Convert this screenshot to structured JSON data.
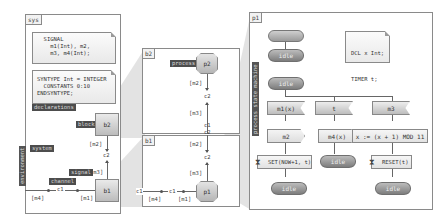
{
  "sys_panel": {
    "tag": "sys",
    "signal_note": "  SIGNAL\n    m1(Int), m2,\n    m3, m4(Int);",
    "syntype_note": "SYNTYPE Int = INTEGER\n  CONSTANTS 0:10\nENDSYNTYPE;",
    "labels": {
      "declarations": "declarations",
      "block": "block",
      "system": "system",
      "signal": "signal",
      "channel": "channel",
      "environment": "environment"
    },
    "blocks": {
      "b2": "b2",
      "b1": "b1"
    },
    "channels": {
      "c1": "c1",
      "c2": "c2"
    },
    "signal_lists": {
      "m2": "[m2]",
      "m3": "[m3]",
      "m4": "[m4]",
      "m1": "[m1]"
    }
  },
  "b2_panel": {
    "tag": "b2",
    "process_label": "process",
    "process": "p2",
    "channel": "c2",
    "signal_m2": "[m2]",
    "signal_m3": "[m3]",
    "gate_c1": "c1",
    "gate_c2": "c2"
  },
  "b1_panel": {
    "tag": "b1",
    "process": "p1",
    "channel_c2": "c2",
    "channel_c1": "c1",
    "signal_m2": "[m2]",
    "signal_m3": "[m3]",
    "signal_m4": "[m4]",
    "signal_m1": "[m1]",
    "gate_c1": "c1"
  },
  "p1_panel": {
    "tag": "p1",
    "vertical_label": "process state machine",
    "decl_note": {
      "line1": "DCL x Int;",
      "line2": "TIMER t;"
    },
    "states": {
      "idle": "idle"
    },
    "inputs": [
      "m1(x)",
      "t",
      "m3"
    ],
    "outputs": [
      "m2",
      "m4(x)"
    ],
    "task": "x := (x + 1) MOD 11",
    "timer_set": "SET(NOW+1, t)",
    "timer_reset": "RESET(t)"
  },
  "colors": {
    "frame_border": "#8a8a8a",
    "label_bg": "#4d4d4d",
    "state_fill": "#8c8c8c",
    "wedge": "#d9d9d9"
  }
}
